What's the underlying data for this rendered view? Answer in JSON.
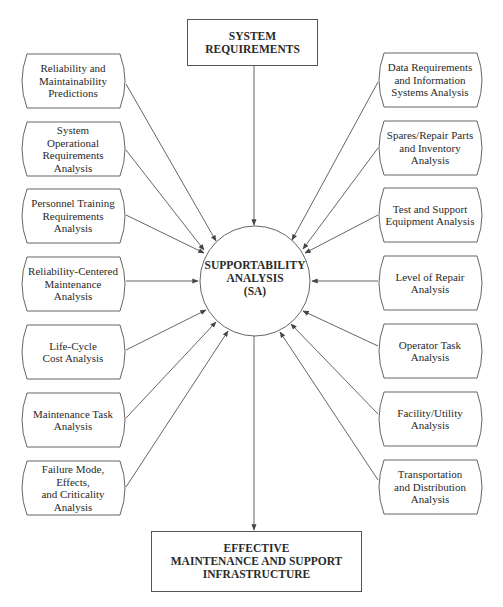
{
  "diagram": {
    "top_box": {
      "label": "SYSTEM\nREQUIREMENTS"
    },
    "center": {
      "label": "SUPPORTABILITY\nANALYSIS\n(SA)"
    },
    "bottom_box": {
      "label": "EFFECTIVE\nMAINTENANCE AND SUPPORT\nINFRASTRUCTURE"
    },
    "left_nodes": [
      {
        "label": "Reliability and\nMaintainability\nPredictions"
      },
      {
        "label": "System\nOperational\nRequirements\nAnalysis"
      },
      {
        "label": "Personnel Training\nRequirements\nAnalysis"
      },
      {
        "label": "Reliability-Centered\nMaintenance\nAnalysis"
      },
      {
        "label": "Life-Cycle\nCost Analysis"
      },
      {
        "label": "Maintenance Task\nAnalysis"
      },
      {
        "label": "Failure Mode, Effects,\nand Criticality\nAnalysis"
      }
    ],
    "right_nodes": [
      {
        "label": "Data Requirements\nand Information\nSystems Analysis"
      },
      {
        "label": "Spares/Repair Parts\nand Inventory\nAnalysis"
      },
      {
        "label": "Test and Support\nEquipment Analysis"
      },
      {
        "label": "Level of Repair\nAnalysis"
      },
      {
        "label": "Operator Task\nAnalysis"
      },
      {
        "label": "Facility/Utility\nAnalysis"
      },
      {
        "label": "Transportation\nand Distribution\nAnalysis"
      }
    ],
    "colors": {
      "line": "#555555",
      "text": "#2a2a2a",
      "background": "#ffffff"
    }
  }
}
